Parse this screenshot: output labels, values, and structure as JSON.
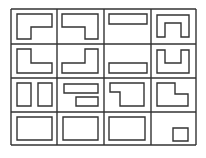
{
  "diagram": {
    "title": "",
    "stroke_color": "#333333",
    "background": "#ffffff",
    "grid": {
      "columns": [
        11,
        57,
        104,
        151,
        196
      ],
      "rows": [
        9,
        44,
        78,
        112,
        145
      ]
    },
    "cells": [
      {
        "row": 1,
        "col": 1,
        "name": "l-shape-notch-bottom-right",
        "polygons": [
          "17,14 52,14 52,27 31,27 31,39 17,39"
        ]
      },
      {
        "row": 1,
        "col": 2,
        "name": "l-shape-notch-bottom-left",
        "polygons": [
          "62,14 98,14 98,39 85,39 85,27 62,27"
        ]
      },
      {
        "row": 1,
        "col": 3,
        "name": "bar-top",
        "polygons": [
          "109,14 147,14 147,24 109,24"
        ]
      },
      {
        "row": 1,
        "col": 4,
        "name": "arch-shape",
        "polygons": [
          "157,15 189,15 189,37 181,37 181,23 165,23 165,37 157,37"
        ]
      },
      {
        "row": 2,
        "col": 1,
        "name": "l-shape-notch-top-right",
        "polygons": [
          "17,49 31,49 31,63 52,63 52,73 17,73"
        ]
      },
      {
        "row": 2,
        "col": 2,
        "name": "l-shape-notch-top-left",
        "polygons": [
          "85,49 98,49 98,73 62,73 62,63 85,63"
        ]
      },
      {
        "row": 2,
        "col": 3,
        "name": "bar-bottom",
        "polygons": [
          "109,63 147,63 147,73 109,73"
        ]
      },
      {
        "row": 2,
        "col": 4,
        "name": "u-shape",
        "polygons": [
          "157,50 165,50 165,63 181,63 181,50 189,50 189,73 157,73"
        ]
      },
      {
        "row": 3,
        "col": 1,
        "name": "two-vertical-bars",
        "polygons": [
          "17,83 31,83 31,106 17,106",
          "38,83 52,83 52,106 38,106"
        ]
      },
      {
        "row": 3,
        "col": 2,
        "name": "two-horizontal-bars",
        "polygons": [
          "64,84 98,84 98,93 64,93",
          "76,97 98,97 98,106 76,106"
        ]
      },
      {
        "row": 3,
        "col": 3,
        "name": "step-shape-top-left",
        "polygons": [
          "110,83 144,83 144,106 120,106 120,92 110,92"
        ]
      },
      {
        "row": 3,
        "col": 4,
        "name": "step-shape-top-right",
        "polygons": [
          "157,83 175,83 175,94 188,94 188,106 157,106"
        ]
      },
      {
        "row": 4,
        "col": 1,
        "name": "rectangle",
        "polygons": [
          "17,117 52,117 52,140 17,140"
        ]
      },
      {
        "row": 4,
        "col": 2,
        "name": "rectangle",
        "polygons": [
          "63,117 98,117 98,140 63,140"
        ]
      },
      {
        "row": 4,
        "col": 3,
        "name": "rectangle",
        "polygons": [
          "109,117 145,117 145,140 109,140"
        ]
      },
      {
        "row": 4,
        "col": 4,
        "name": "small-rectangle",
        "polygons": [
          "173,128 188,128 188,141 173,141"
        ]
      }
    ]
  }
}
